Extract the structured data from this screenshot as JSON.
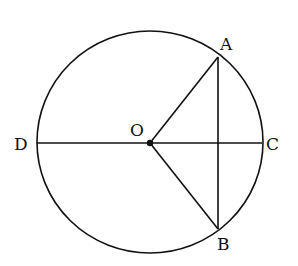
{
  "diagram": {
    "center": {
      "label": "O",
      "x": 150,
      "y": 143
    },
    "radius": 112,
    "points": {
      "A": {
        "label": "A",
        "x": 218,
        "y": 57
      },
      "B": {
        "label": "B",
        "x": 218,
        "y": 229
      },
      "C": {
        "label": "C",
        "x": 262,
        "y": 143
      },
      "D": {
        "label": "D",
        "x": 37,
        "y": 143
      }
    },
    "segments": [
      "DC",
      "OA",
      "OB",
      "AB"
    ],
    "stroke_color": "#111111"
  }
}
